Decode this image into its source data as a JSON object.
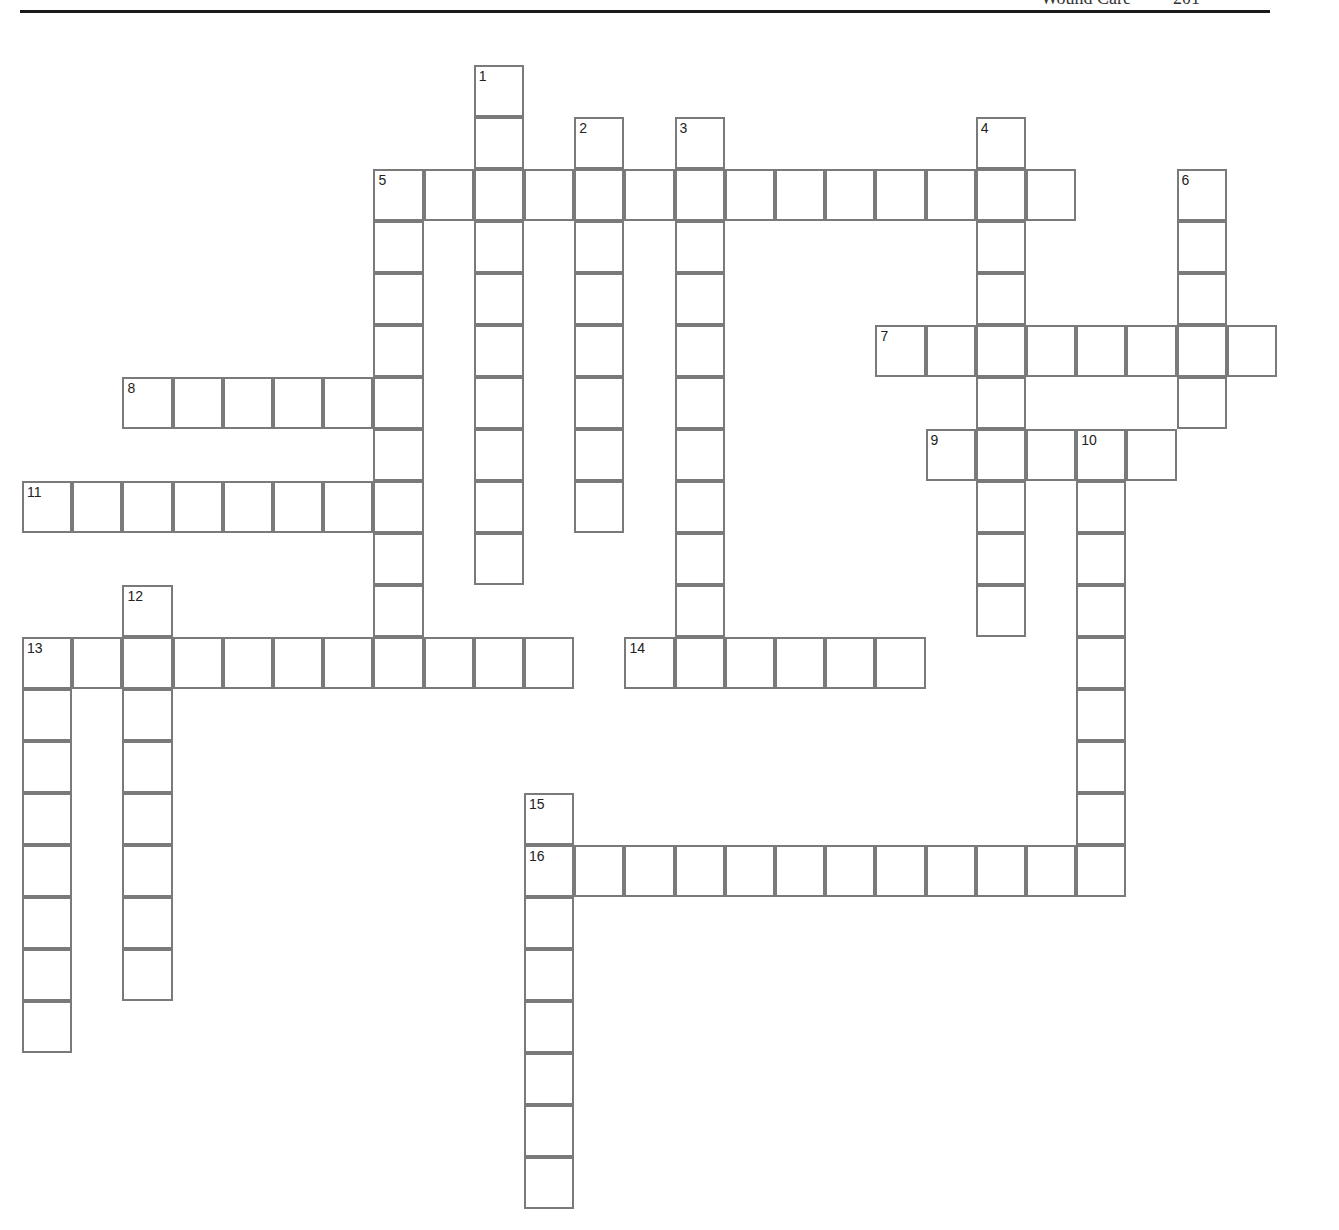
{
  "header": {
    "title": "Wound Care",
    "page_number": "201"
  },
  "grid": {
    "origin_x": 23,
    "origin_y": 66,
    "cell_w": 50.2,
    "cell_h": 52,
    "border_color": "#7a7a7a"
  },
  "entries": [
    {
      "number": "1",
      "dir": "down",
      "row": 0,
      "col": 9,
      "length": 10
    },
    {
      "number": "2",
      "dir": "down",
      "row": 1,
      "col": 11,
      "length": 8
    },
    {
      "number": "3",
      "dir": "down",
      "row": 1,
      "col": 13,
      "length": 11
    },
    {
      "number": "4",
      "dir": "down",
      "row": 1,
      "col": 19,
      "length": 10
    },
    {
      "number": "5",
      "dir": "across",
      "row": 2,
      "col": 7,
      "length": 14
    },
    {
      "number": "5",
      "dir": "down",
      "row": 2,
      "col": 7,
      "length": 10
    },
    {
      "number": "6",
      "dir": "down",
      "row": 2,
      "col": 23,
      "length": 5
    },
    {
      "number": "7",
      "dir": "across",
      "row": 5,
      "col": 17,
      "length": 8
    },
    {
      "number": "8",
      "dir": "across",
      "row": 6,
      "col": 2,
      "length": 6
    },
    {
      "number": "9",
      "dir": "across",
      "row": 7,
      "col": 18,
      "length": 5
    },
    {
      "number": "10",
      "dir": "down",
      "row": 7,
      "col": 21,
      "length": 9
    },
    {
      "number": "11",
      "dir": "across",
      "row": 8,
      "col": 0,
      "length": 8
    },
    {
      "number": "12",
      "dir": "down",
      "row": 10,
      "col": 2,
      "length": 8
    },
    {
      "number": "13",
      "dir": "across",
      "row": 11,
      "col": 0,
      "length": 11
    },
    {
      "number": "13",
      "dir": "down",
      "row": 11,
      "col": 0,
      "length": 8
    },
    {
      "number": "14",
      "dir": "across",
      "row": 11,
      "col": 12,
      "length": 6
    },
    {
      "number": "15",
      "dir": "down",
      "row": 14,
      "col": 10,
      "length": 8
    },
    {
      "number": "16",
      "dir": "across",
      "row": 15,
      "col": 10,
      "length": 12
    }
  ]
}
